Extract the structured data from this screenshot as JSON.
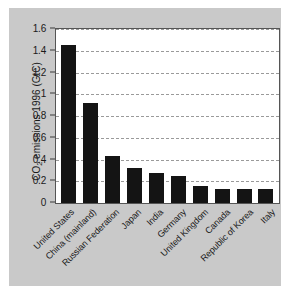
{
  "chart_data": {
    "type": "bar",
    "title": "",
    "subtitle": "",
    "xlabel": "",
    "ylabel": "CO2 emissions 1996 (GtC)",
    "ylabel_parts": {
      "pre": "CO",
      "sub": "2",
      "post": " emissions 1996 (GtC)"
    },
    "categories": [
      "United States",
      "China (mainland)",
      "Russian Federation",
      "Japan",
      "India",
      "Germany",
      "United Kingdom",
      "Canada",
      "Republic of Korea",
      "Italy"
    ],
    "values": [
      1.45,
      0.92,
      0.43,
      0.32,
      0.28,
      0.245,
      0.16,
      0.125,
      0.125,
      0.125
    ],
    "ylim": [
      0,
      1.6
    ],
    "yticks": [
      0,
      0.2,
      0.4,
      0.6,
      0.8,
      1,
      1.2,
      1.4,
      1.6
    ],
    "ytick_labels": [
      "0",
      "0.2",
      "0.4",
      "0.6",
      "0.8",
      "1",
      "1.2",
      "1.4",
      "1.6"
    ],
    "grid": "horizontal-dashed",
    "legend": "none",
    "bar_color": "#141414",
    "panel_color": "#c9c9c9",
    "plot_background": "#ffffff",
    "gridline_color": "#9a9a9a"
  }
}
